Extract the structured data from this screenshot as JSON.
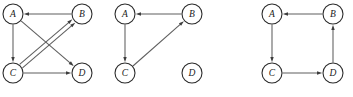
{
  "figure": {
    "width": 353,
    "height": 97,
    "background_color": "#ffffff",
    "node_stroke_color": "#2b2b2b",
    "node_fill_color": "#ffffff",
    "edge_color": "#5e5e5e",
    "arrow_color": "#3d3d3d",
    "label_color": "#1a1a1a",
    "node_radius": 10
  },
  "graphs": [
    {
      "id": "graph-1",
      "index": 1,
      "nodes": [
        {
          "id": "A",
          "label": "A",
          "cx": 13,
          "cy": 14
        },
        {
          "id": "B",
          "label": "B",
          "cx": 82,
          "cy": 14
        },
        {
          "id": "C",
          "label": "C",
          "cx": 13,
          "cy": 73
        },
        {
          "id": "D",
          "label": "D",
          "cx": 82,
          "cy": 73
        }
      ],
      "edges": [
        {
          "from": "B",
          "to": "A",
          "offset": 0
        },
        {
          "from": "A",
          "to": "C",
          "offset": 0
        },
        {
          "from": "A",
          "to": "D",
          "offset": 0
        },
        {
          "from": "C",
          "to": "D",
          "offset": 0
        },
        {
          "from": "C",
          "to": "B",
          "offset": -2.2
        },
        {
          "from": "C",
          "to": "B",
          "offset": 2.2
        }
      ]
    },
    {
      "id": "graph-2",
      "index": 2,
      "nodes": [
        {
          "id": "A",
          "label": "A",
          "cx": 125,
          "cy": 14
        },
        {
          "id": "B",
          "label": "B",
          "cx": 192,
          "cy": 14
        },
        {
          "id": "C",
          "label": "C",
          "cx": 125,
          "cy": 73
        },
        {
          "id": "D",
          "label": "D",
          "cx": 192,
          "cy": 73
        }
      ],
      "edges": [
        {
          "from": "B",
          "to": "A",
          "offset": 0
        },
        {
          "from": "A",
          "to": "C",
          "offset": 0
        },
        {
          "from": "C",
          "to": "B",
          "offset": 0
        }
      ]
    },
    {
      "id": "graph-3",
      "index": 3,
      "nodes": [
        {
          "id": "A",
          "label": "A",
          "cx": 272,
          "cy": 14
        },
        {
          "id": "B",
          "label": "B",
          "cx": 333,
          "cy": 14
        },
        {
          "id": "C",
          "label": "C",
          "cx": 272,
          "cy": 73
        },
        {
          "id": "D",
          "label": "D",
          "cx": 333,
          "cy": 73
        }
      ],
      "edges": [
        {
          "from": "B",
          "to": "A",
          "offset": 0
        },
        {
          "from": "A",
          "to": "C",
          "offset": 0
        },
        {
          "from": "C",
          "to": "D",
          "offset": 0
        },
        {
          "from": "D",
          "to": "B",
          "offset": 0
        }
      ]
    }
  ]
}
